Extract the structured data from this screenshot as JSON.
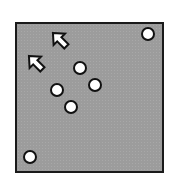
{
  "diagram": {
    "background_color": "#9c9c9c",
    "border_color": "#1a1a1a",
    "circles": [
      {
        "cx": 148,
        "cy": 34,
        "r": 6
      },
      {
        "cx": 80,
        "cy": 68,
        "r": 6
      },
      {
        "cx": 95,
        "cy": 85,
        "r": 6
      },
      {
        "cx": 57,
        "cy": 90,
        "r": 6
      },
      {
        "cx": 71,
        "cy": 107,
        "r": 6
      },
      {
        "cx": 30,
        "cy": 157,
        "r": 6
      }
    ],
    "arrows": [
      {
        "x": 60,
        "y": 40,
        "direction": "up-left"
      },
      {
        "x": 36,
        "y": 63,
        "direction": "up-left"
      }
    ]
  }
}
